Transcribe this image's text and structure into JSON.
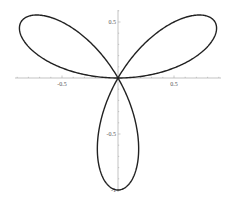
{
  "chart_data": {
    "type": "line",
    "title": "",
    "xlabel": "",
    "ylabel": "",
    "equation": "r = sin(3θ)",
    "theta_range": [
      0,
      3.14159
    ],
    "xlim": [
      -0.93,
      0.93
    ],
    "ylim": [
      -1.0,
      0.6
    ],
    "grid": false,
    "legend": null,
    "x_ticks": [
      {
        "value": -0.5,
        "label": "-0.5"
      },
      {
        "value": 0.5,
        "label": "0.5"
      }
    ],
    "y_ticks": [
      {
        "value": 0.5,
        "label": "0.5"
      },
      {
        "value": -0.5,
        "label": "-0.5"
      },
      {
        "value": -1.0,
        "label": "-1"
      }
    ],
    "petal_tips": [
      {
        "x": 0.866,
        "y": 0.5
      },
      {
        "x": -0.866,
        "y": 0.5
      },
      {
        "x": 0.0,
        "y": -1.0
      }
    ],
    "line_color": "#222222",
    "axis_color": "#aaaaaa"
  },
  "layout": {
    "origin_px": [
      118,
      78
    ],
    "scale_px_per_unit": 112,
    "x_axis_px": [
      15,
      221
    ],
    "y_axis_px": [
      10,
      192
    ]
  }
}
